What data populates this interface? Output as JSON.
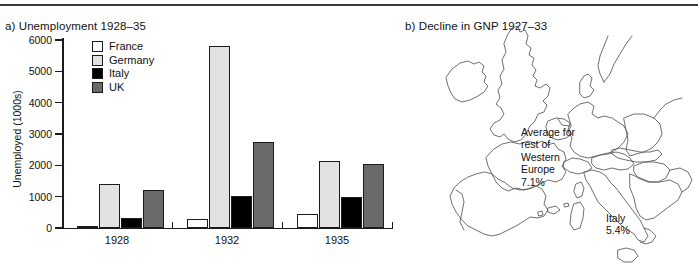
{
  "figure": {
    "panel_a_title": "a) Unemployment 1928–35",
    "panel_b_title": "b) Decline in GNP 1927–33"
  },
  "chart_data": {
    "type": "bar",
    "title": "a) Unemployment 1928–35",
    "xlabel": "",
    "ylabel": "Unemployed (1000s)",
    "ylim": [
      0,
      6000
    ],
    "yticks": [
      0,
      1000,
      2000,
      3000,
      4000,
      5000,
      6000
    ],
    "ytick_labels": [
      "0",
      "1000",
      "2000",
      "3000",
      "4000",
      "5000",
      "6000"
    ],
    "categories": [
      "1928",
      "1932",
      "1935"
    ],
    "grid": false,
    "legend_position": "upper-left-inside",
    "series": [
      {
        "name": "France",
        "color": "#ffffff",
        "values": [
          70,
          300,
          460
        ]
      },
      {
        "name": "Germany",
        "color": "#e2e2e2",
        "values": [
          1400,
          5800,
          2150
        ]
      },
      {
        "name": "Italy",
        "color": "#000000",
        "values": [
          320,
          1010,
          990
        ]
      },
      {
        "name": "UK",
        "color": "#6a6a6a",
        "values": [
          1210,
          2730,
          2050
        ]
      }
    ]
  },
  "map": {
    "title": "b) Decline in GNP 1927–33",
    "annotations": [
      {
        "name": "western-europe-average",
        "text": "Average for\nrest of\nWestern\nEurope\n7.1%",
        "value": "7.1%"
      },
      {
        "name": "italy-decline",
        "text": "Italy\n5.4%",
        "value": "5.4%"
      }
    ],
    "region": "Western Europe outline map",
    "outline_color": "#555555"
  }
}
